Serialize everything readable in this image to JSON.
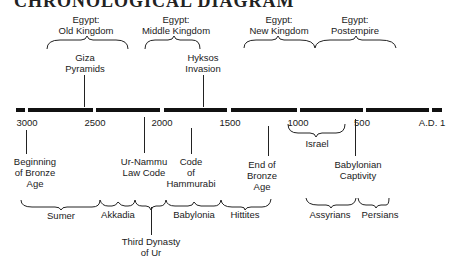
{
  "title": "CHRONOLOGICAL DIAGRAM",
  "timeline": {
    "year_labels": [
      {
        "label": "3000",
        "x": 27
      },
      {
        "label": "2500",
        "x": 95
      },
      {
        "label": "2000",
        "x": 162
      },
      {
        "label": "1500",
        "x": 230
      },
      {
        "label": "1000",
        "x": 298
      },
      {
        "label": "500",
        "x": 362
      },
      {
        "label": "A.D. 1",
        "x": 432
      }
    ],
    "segments": [
      {
        "x": 16,
        "w": 9
      },
      {
        "x": 28,
        "w": 65
      },
      {
        "x": 96,
        "w": 64
      },
      {
        "x": 164,
        "w": 63
      },
      {
        "x": 231,
        "w": 66
      },
      {
        "x": 300,
        "w": 63
      },
      {
        "x": 366,
        "w": 63
      },
      {
        "x": 432,
        "w": 10
      }
    ]
  },
  "above": {
    "egypt_periods": [
      {
        "label": "Egypt:\nOld Kingdom",
        "x": 86
      },
      {
        "label": "Egypt:\nMiddle Kingdom",
        "x": 176
      },
      {
        "label": "Egypt:\nNew Kingdom",
        "x": 279
      },
      {
        "label": "Egypt:\nPostempire",
        "x": 355
      }
    ],
    "events": [
      {
        "label": "Giza\nPyramids",
        "x": 85
      },
      {
        "label": "Hyksos\nInvasion",
        "x": 203
      }
    ]
  },
  "below": {
    "events": [
      {
        "label": "Beginning\nof Bronze\nAge",
        "x": 35
      },
      {
        "label": "Ur-Nammu\nLaw Code",
        "x": 144
      },
      {
        "label": "Code\nof\nHammurabi",
        "x": 191
      },
      {
        "label": "End of\nBronze\nAge",
        "x": 262
      },
      {
        "label": "Babylonian\nCaptivity",
        "x": 358
      }
    ],
    "israel": {
      "label": "Israel",
      "x": 317
    },
    "civilizations": [
      {
        "label": "Sumer",
        "x": 61
      },
      {
        "label": "Akkadia",
        "x": 118
      },
      {
        "label": "Babylonia",
        "x": 194
      },
      {
        "label": "Hittites",
        "x": 245
      },
      {
        "label": "Assyrians",
        "x": 330
      },
      {
        "label": "Persians",
        "x": 380
      }
    ],
    "third_dynasty": {
      "label": "Third Dynasty\nof Ur",
      "x": 151
    }
  }
}
